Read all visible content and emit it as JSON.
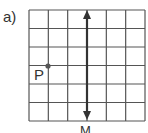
{
  "figure": {
    "part_label": "a)",
    "grid": {
      "columns": 6,
      "rows": 6,
      "left": 29,
      "top": 10,
      "right": 145,
      "bottom": 121,
      "line_color": "#555555"
    },
    "point": {
      "label": "P",
      "x": 48,
      "y": 66,
      "color": "#555555"
    },
    "mirror_line": {
      "label": "M",
      "x": 87,
      "y_top": 11,
      "y_bottom": 119,
      "color": "#333333",
      "double_arrow": true
    }
  }
}
